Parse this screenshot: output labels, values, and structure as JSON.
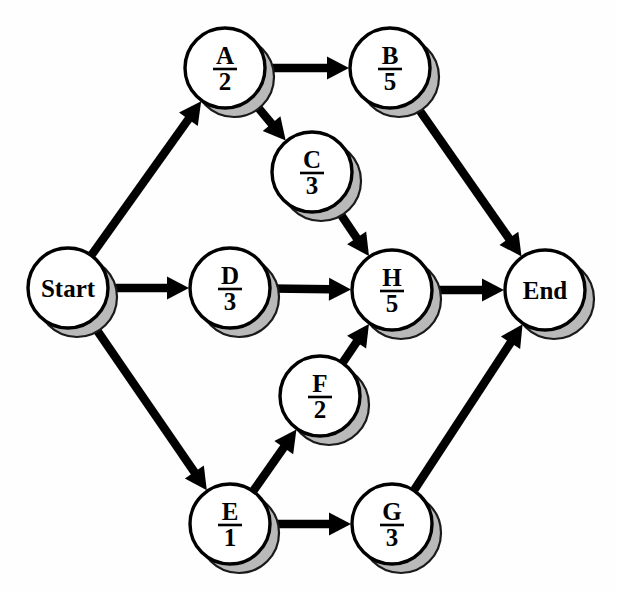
{
  "diagram": {
    "kind": "activity-on-node-network",
    "title": "",
    "background_color": "#fefefe",
    "node_fill": "#ffffff",
    "node_stroke": "#000000",
    "shadow_color": "#b9b9b9",
    "edge_color": "#000000",
    "node_radius": 40,
    "nodes": [
      {
        "id": "start",
        "label": "Start",
        "value": "",
        "type": "terminal",
        "cx": 68,
        "cy": 288
      },
      {
        "id": "A",
        "label": "A",
        "value": "2",
        "type": "task",
        "cx": 225,
        "cy": 68
      },
      {
        "id": "B",
        "label": "B",
        "value": "5",
        "type": "task",
        "cx": 390,
        "cy": 68
      },
      {
        "id": "C",
        "label": "C",
        "value": "3",
        "type": "task",
        "cx": 312,
        "cy": 172
      },
      {
        "id": "D",
        "label": "D",
        "value": "3",
        "type": "task",
        "cx": 230,
        "cy": 288
      },
      {
        "id": "H",
        "label": "H",
        "value": "5",
        "type": "task",
        "cx": 392,
        "cy": 290
      },
      {
        "id": "F",
        "label": "F",
        "value": "2",
        "type": "task",
        "cx": 320,
        "cy": 396
      },
      {
        "id": "E",
        "label": "E",
        "value": "1",
        "type": "task",
        "cx": 230,
        "cy": 524
      },
      {
        "id": "G",
        "label": "G",
        "value": "3",
        "type": "task",
        "cx": 392,
        "cy": 524
      },
      {
        "id": "end",
        "label": "End",
        "value": "",
        "type": "terminal",
        "cx": 545,
        "cy": 290
      }
    ],
    "edges": [
      {
        "id": "start-A",
        "from": "start",
        "to": "A"
      },
      {
        "id": "start-D",
        "from": "start",
        "to": "D"
      },
      {
        "id": "start-E",
        "from": "start",
        "to": "E"
      },
      {
        "id": "A-B",
        "from": "A",
        "to": "B"
      },
      {
        "id": "A-C",
        "from": "A",
        "to": "C"
      },
      {
        "id": "C-H",
        "from": "C",
        "to": "H"
      },
      {
        "id": "D-H",
        "from": "D",
        "to": "H"
      },
      {
        "id": "F-H",
        "from": "F",
        "to": "H"
      },
      {
        "id": "B-end",
        "from": "B",
        "to": "end"
      },
      {
        "id": "H-end",
        "from": "H",
        "to": "end"
      },
      {
        "id": "G-end",
        "from": "G",
        "to": "end"
      },
      {
        "id": "E-F",
        "from": "E",
        "to": "F"
      },
      {
        "id": "E-G",
        "from": "E",
        "to": "G"
      }
    ]
  }
}
